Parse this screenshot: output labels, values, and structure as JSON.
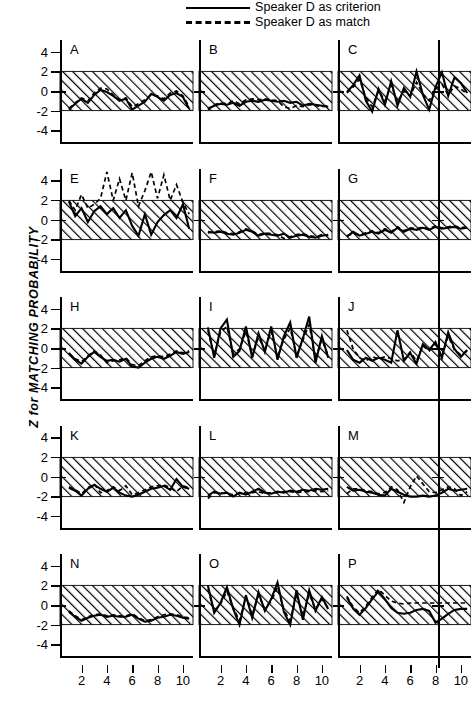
{
  "legend": {
    "items": [
      {
        "label": "Speaker D as criterion",
        "style": "solid",
        "key_name": "solid-line-key"
      },
      {
        "label": "Speaker D as match",
        "style": "dashed",
        "key_name": "dashed-line-key"
      }
    ]
  },
  "axes": {
    "ylabel": "Z for MATCHING PROBABILITY",
    "yticks": [
      4,
      2,
      0,
      -2,
      -4
    ],
    "yticklabels": [
      "4",
      "2",
      "0",
      "-2",
      "-4"
    ],
    "ylim": [
      -5.2,
      5.2
    ],
    "xticks": [
      2,
      4,
      6,
      8,
      10
    ],
    "xticklabels": [
      "2",
      "4",
      "6",
      "8",
      "10"
    ],
    "xlim": [
      0.3,
      10.8
    ],
    "band": {
      "low": -2,
      "high": 2,
      "fill": "diagonal-hatch",
      "color": "#000000"
    }
  },
  "chart_data": {
    "type": "line",
    "title": "",
    "xlabel": "",
    "ylabel": "Z for MATCHING PROBABILITY",
    "ylim": [
      -5.2,
      5.2
    ],
    "xlim": [
      0.3,
      10.8
    ],
    "grid": false,
    "legend_position": "top-right",
    "shaded_band": {
      "from": -2,
      "to": 2,
      "label": "non-significant region",
      "hatch": true
    },
    "x": [
      1,
      1.5,
      2,
      2.5,
      3,
      3.5,
      4,
      4.5,
      5,
      5.5,
      6,
      6.5,
      7,
      7.5,
      8,
      8.5,
      9,
      9.5,
      10,
      10.5
    ],
    "panels": [
      {
        "id": "A",
        "row": 0,
        "col": 0,
        "series": [
          {
            "name": "Speaker D as criterion",
            "style": "solid",
            "values": [
              -1.9,
              -1.3,
              -0.8,
              -1.2,
              -0.4,
              0.1,
              -0.1,
              -0.5,
              -1.0,
              -0.8,
              -1.9,
              -1.5,
              -1.1,
              -0.3,
              -0.6,
              -1.0,
              -0.4,
              -0.2,
              -0.6,
              -1.8
            ]
          },
          {
            "name": "Speaker D as match",
            "style": "dashed",
            "values": [
              -1.8,
              -1.2,
              -0.7,
              -1.0,
              -0.2,
              0.3,
              0.2,
              -0.4,
              -0.9,
              -0.7,
              -1.6,
              -1.3,
              -0.9,
              -0.4,
              -0.5,
              -0.8,
              -0.2,
              0.0,
              -0.5,
              -1.6
            ]
          }
        ]
      },
      {
        "id": "B",
        "row": 0,
        "col": 1,
        "series": [
          {
            "name": "Speaker D as criterion",
            "style": "solid",
            "values": [
              -1.8,
              -1.5,
              -1.3,
              -1.4,
              -1.2,
              -1.5,
              -1.1,
              -1.0,
              -1.1,
              -0.9,
              -1.0,
              -1.1,
              -1.0,
              -1.2,
              -1.1,
              -1.5,
              -1.3,
              -1.4,
              -1.5,
              -1.6
            ]
          },
          {
            "name": "Speaker D as match",
            "style": "dashed",
            "values": [
              -1.9,
              -1.4,
              -1.2,
              -1.3,
              -1.0,
              -1.3,
              -0.9,
              -0.8,
              -0.9,
              -0.8,
              -0.9,
              -1.0,
              -1.6,
              -1.8,
              -1.5,
              -1.6,
              -1.4,
              -1.5,
              -1.6,
              -1.5
            ]
          }
        ]
      },
      {
        "id": "C",
        "row": 0,
        "col": 2,
        "series": [
          {
            "name": "Speaker D as criterion",
            "style": "solid",
            "values": [
              -0.1,
              0.6,
              1.6,
              -1.0,
              -2.1,
              0.2,
              -1.4,
              1.0,
              -1.5,
              0.3,
              -0.6,
              2.0,
              -0.4,
              -1.9,
              0.4,
              1.9,
              -0.5,
              1.4,
              0.8,
              -0.2
            ]
          },
          {
            "name": "Speaker D as match",
            "style": "dashed",
            "values": [
              -0.2,
              0.4,
              1.2,
              -0.7,
              -1.6,
              0.0,
              -1.0,
              0.6,
              -1.1,
              0.0,
              -0.5,
              0.9,
              -0.3,
              -1.0,
              0.2,
              0.7,
              -0.4,
              0.5,
              0.2,
              -0.3
            ]
          }
        ]
      },
      {
        "id": "E",
        "row": 1,
        "col": 0,
        "series": [
          {
            "name": "Speaker D as criterion",
            "style": "solid",
            "values": [
              1.9,
              0.4,
              1.2,
              -0.2,
              0.9,
              1.4,
              0.6,
              1.2,
              0.2,
              1.0,
              -0.6,
              -1.6,
              0.6,
              -1.5,
              -0.2,
              0.5,
              1.0,
              0.2,
              1.6,
              -0.9
            ]
          },
          {
            "name": "Speaker D as match",
            "style": "dashed",
            "values": [
              2.0,
              1.0,
              2.6,
              1.2,
              1.6,
              2.2,
              4.9,
              2.0,
              4.2,
              2.0,
              4.8,
              1.4,
              3.0,
              4.9,
              2.2,
              4.6,
              2.0,
              3.6,
              1.8,
              0.6
            ]
          }
        ]
      },
      {
        "id": "F",
        "row": 1,
        "col": 1,
        "series": [
          {
            "name": "Speaker D as criterion",
            "style": "solid",
            "values": [
              -1.2,
              -1.3,
              -1.2,
              -1.4,
              -1.5,
              -1.3,
              -1.0,
              -1.2,
              -1.6,
              -1.4,
              -1.5,
              -1.6,
              -1.4,
              -1.8,
              -1.6,
              -1.5,
              -1.7,
              -1.8,
              -1.6,
              -1.5
            ]
          },
          {
            "name": "Speaker D as match",
            "style": "dashed",
            "values": [
              -1.3,
              -1.2,
              -1.1,
              -1.3,
              -1.4,
              -1.2,
              -0.9,
              -1.1,
              -1.5,
              -1.3,
              -1.4,
              -1.5,
              -1.9,
              -1.7,
              -1.5,
              -1.4,
              -1.6,
              -1.7,
              -1.5,
              -1.6
            ]
          }
        ]
      },
      {
        "id": "G",
        "row": 1,
        "col": 2,
        "series": [
          {
            "name": "Speaker D as criterion",
            "style": "solid",
            "values": [
              -1.7,
              -1.2,
              -1.6,
              -1.4,
              -1.2,
              -1.4,
              -1.0,
              -1.3,
              -0.8,
              -1.2,
              -0.9,
              -1.0,
              -0.8,
              -1.0,
              -0.7,
              -0.9,
              -0.8,
              -0.7,
              -0.9,
              -0.8
            ]
          },
          {
            "name": "Speaker D as match",
            "style": "dashed",
            "values": [
              -1.6,
              -1.4,
              -1.5,
              -1.3,
              -1.1,
              -1.3,
              -0.9,
              -1.2,
              -0.7,
              -1.1,
              -0.8,
              -0.9,
              -0.7,
              -0.9,
              -0.6,
              -0.8,
              -0.7,
              -0.6,
              -0.8,
              -0.7
            ]
          }
        ]
      },
      {
        "id": "H",
        "row": 2,
        "col": 0,
        "series": [
          {
            "name": "Speaker D as criterion",
            "style": "solid",
            "values": [
              -0.5,
              -1.2,
              -1.6,
              -0.9,
              -0.4,
              -0.9,
              -1.3,
              -1.2,
              -1.4,
              -1.1,
              -1.9,
              -2.0,
              -1.5,
              -1.1,
              -0.9,
              -1.1,
              -0.8,
              -0.4,
              -0.6,
              -0.4
            ]
          },
          {
            "name": "Speaker D as match",
            "style": "dashed",
            "values": [
              -0.6,
              -1.1,
              -1.4,
              -0.8,
              -0.3,
              -0.7,
              -1.5,
              -1.3,
              -1.2,
              -1.0,
              -1.7,
              -1.8,
              -1.3,
              -0.9,
              -0.8,
              -0.9,
              -0.6,
              -0.3,
              -0.5,
              -0.3
            ]
          }
        ]
      },
      {
        "id": "I",
        "row": 2,
        "col": 1,
        "series": [
          {
            "name": "Speaker D as criterion",
            "style": "solid",
            "values": [
              2.1,
              -1.0,
              2.0,
              2.9,
              -0.9,
              -0.3,
              2.2,
              -1.0,
              1.5,
              -0.4,
              2.2,
              -1.2,
              1.2,
              2.6,
              -1.0,
              1.0,
              3.2,
              -1.5,
              1.2,
              -1.0
            ]
          },
          {
            "name": "Speaker D as match",
            "style": "dashed",
            "values": [
              1.8,
              -0.8,
              1.6,
              2.2,
              -0.6,
              -0.1,
              1.7,
              -0.8,
              1.1,
              -0.2,
              1.7,
              -0.9,
              0.9,
              2.0,
              -0.7,
              0.8,
              2.4,
              -1.1,
              0.9,
              -0.8
            ]
          }
        ]
      },
      {
        "id": "J",
        "row": 2,
        "col": 2,
        "series": [
          {
            "name": "Speaker D as criterion",
            "style": "solid",
            "values": [
              -0.2,
              -1.2,
              -1.5,
              -1.0,
              -1.3,
              -1.0,
              -1.2,
              -1.5,
              1.8,
              -1.3,
              -0.5,
              -1.6,
              0.4,
              -0.2,
              0.6,
              -1.0,
              1.6,
              -0.1,
              -0.9,
              -0.2
            ]
          },
          {
            "name": "Speaker D as match",
            "style": "dashed",
            "values": [
              1.8,
              -0.1,
              -1.0,
              -1.3,
              -0.9,
              -1.1,
              -0.9,
              -1.1,
              -1.3,
              -1.2,
              -0.4,
              -1.3,
              0.2,
              -0.3,
              0.4,
              -0.8,
              1.2,
              -0.2,
              -0.7,
              -0.3
            ]
          }
        ]
      },
      {
        "id": "K",
        "row": 3,
        "col": 0,
        "series": [
          {
            "name": "Speaker D as criterion",
            "style": "solid",
            "values": [
              -1.1,
              -1.4,
              -1.9,
              -1.2,
              -0.8,
              -1.2,
              -1.5,
              -1.1,
              -1.6,
              -1.9,
              -2.0,
              -1.8,
              -1.5,
              -1.2,
              -1.1,
              -0.9,
              -1.3,
              -0.2,
              -1.0,
              -1.2
            ]
          },
          {
            "name": "Speaker D as match",
            "style": "dashed",
            "values": [
              -1.0,
              -1.3,
              -1.7,
              -1.1,
              -0.7,
              -1.6,
              -1.4,
              -1.0,
              -1.4,
              -0.9,
              -1.8,
              -1.6,
              -1.3,
              -1.0,
              -0.9,
              -0.8,
              -1.1,
              -1.5,
              -0.9,
              -1.1
            ]
          }
        ]
      },
      {
        "id": "L",
        "row": 3,
        "col": 1,
        "series": [
          {
            "name": "Speaker D as criterion",
            "style": "solid",
            "values": [
              -1.9,
              -1.5,
              -1.7,
              -1.6,
              -2.0,
              -1.6,
              -1.8,
              -1.5,
              -1.2,
              -1.6,
              -1.7,
              -1.5,
              -1.6,
              -1.4,
              -1.5,
              -1.3,
              -1.4,
              -1.2,
              -1.3,
              -1.2
            ]
          },
          {
            "name": "Speaker D as match",
            "style": "dashed",
            "values": [
              -2.2,
              -1.6,
              -1.6,
              -1.7,
              -1.8,
              -1.7,
              -1.6,
              -1.6,
              -1.5,
              -1.7,
              -1.6,
              -1.6,
              -1.5,
              -1.5,
              -1.6,
              -1.5,
              -1.5,
              -1.4,
              -1.5,
              -1.4
            ]
          }
        ]
      },
      {
        "id": "M",
        "row": 3,
        "col": 2,
        "series": [
          {
            "name": "Speaker D as criterion",
            "style": "solid",
            "values": [
              -1.0,
              -1.4,
              -1.3,
              -1.5,
              -1.6,
              -1.8,
              -1.9,
              -1.2,
              -1.5,
              -1.8,
              -2.0,
              -2.0,
              -1.9,
              -2.0,
              -1.9,
              -1.6,
              -1.2,
              -1.4,
              -1.3,
              -1.2
            ]
          },
          {
            "name": "Speaker D as match",
            "style": "dashed",
            "values": [
              -1.7,
              -1.2,
              -1.2,
              -1.4,
              -1.5,
              -1.7,
              -1.6,
              -1.0,
              -1.3,
              -2.6,
              -1.0,
              0.1,
              -0.7,
              -1.5,
              -1.6,
              -1.3,
              -1.0,
              -1.2,
              -1.9,
              -1.5
            ]
          }
        ]
      },
      {
        "id": "N",
        "row": 4,
        "col": 0,
        "series": [
          {
            "name": "Speaker D as criterion",
            "style": "solid",
            "values": [
              -0.7,
              -1.2,
              -1.6,
              -1.3,
              -1.1,
              -1.0,
              -1.2,
              -1.1,
              -1.2,
              -1.2,
              -1.0,
              -1.4,
              -1.7,
              -1.6,
              -1.3,
              -1.2,
              -1.0,
              -1.1,
              -1.3,
              -1.4
            ]
          },
          {
            "name": "Speaker D as match",
            "style": "dashed",
            "values": [
              -0.6,
              -1.1,
              -1.5,
              -1.2,
              -1.0,
              -0.9,
              -1.1,
              -1.0,
              -1.1,
              -1.1,
              -0.9,
              -1.3,
              -1.6,
              -1.5,
              -1.2,
              -1.0,
              -0.9,
              -1.0,
              -1.2,
              -1.3
            ]
          }
        ]
      },
      {
        "id": "O",
        "row": 4,
        "col": 1,
        "series": [
          {
            "name": "Speaker D as criterion",
            "style": "solid",
            "values": [
              2.0,
              -0.8,
              0.2,
              1.8,
              -0.4,
              -2.0,
              1.0,
              -1.3,
              1.3,
              -0.6,
              0.6,
              2.3,
              -0.7,
              -2.0,
              1.5,
              -1.5,
              1.5,
              -0.6,
              0.8,
              -0.4
            ]
          },
          {
            "name": "Speaker D as match",
            "style": "dashed",
            "values": [
              1.6,
              -0.6,
              0.1,
              1.4,
              -0.3,
              -1.6,
              0.8,
              -1.0,
              1.0,
              -0.4,
              0.4,
              1.8,
              -0.5,
              -1.6,
              1.1,
              -1.1,
              1.1,
              -0.4,
              0.6,
              -0.3
            ]
          }
        ]
      },
      {
        "id": "P",
        "row": 4,
        "col": 2,
        "series": [
          {
            "name": "Speaker D as criterion",
            "style": "solid",
            "values": [
              0.8,
              -0.4,
              -1.0,
              -0.3,
              0.6,
              1.4,
              0.6,
              -0.3,
              -0.8,
              -0.9,
              -0.8,
              -0.5,
              -0.4,
              -0.6,
              -1.8,
              -1.4,
              -0.9,
              -0.5,
              -0.4,
              -0.4
            ]
          },
          {
            "name": "Speaker D as match",
            "style": "dashed",
            "values": [
              0.9,
              -0.2,
              -0.8,
              -0.1,
              0.8,
              1.6,
              1.0,
              0.4,
              0.2,
              0.1,
              0.2,
              0.2,
              0.2,
              0.2,
              0.2,
              0.2,
              0.2,
              0.2,
              0.2,
              0.2
            ]
          }
        ]
      }
    ]
  }
}
